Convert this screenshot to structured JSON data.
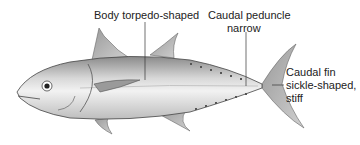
{
  "diagram": {
    "labels": [
      {
        "id": "body",
        "line1": "Body torpedo-shaped",
        "line2": ""
      },
      {
        "id": "peduncle",
        "line1": "Caudal peduncle",
        "line2": "narrow"
      },
      {
        "id": "caudal_fin",
        "line1": "Caudal fin",
        "line2": "sickle-shaped,",
        "line3": "stiff"
      }
    ]
  }
}
